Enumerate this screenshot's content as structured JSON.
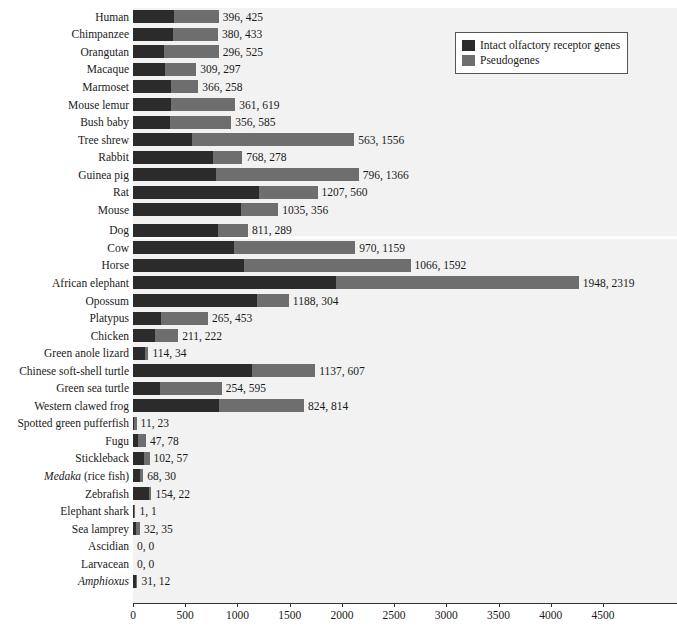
{
  "legend": {
    "position": "top-right",
    "items": [
      {
        "label": "Intact olfactory receptor genes",
        "color": "#2b2b2b",
        "name": "intact"
      },
      {
        "label": "Pseudogenes",
        "color": "#6e6e6e",
        "name": "pseudogenes"
      }
    ]
  },
  "chart_data": {
    "type": "bar",
    "orientation": "horizontal",
    "stacked": true,
    "title": "",
    "xlabel": "",
    "ylabel": "",
    "xlim": [
      0,
      4700
    ],
    "xticks": [
      0,
      500,
      1000,
      1500,
      2000,
      2500,
      3000,
      3500,
      4000,
      4500
    ],
    "xticklabels": [
      "0",
      "500",
      "1000",
      "1500",
      "2000",
      "2500",
      "3000",
      "3500",
      "4000",
      "4500"
    ],
    "grid": false,
    "legend_entries": [
      "Intact olfactory receptor genes",
      "Pseudogenes"
    ],
    "series": [
      {
        "name": "Intact olfactory receptor genes",
        "color": "#2b2b2b",
        "values": [
          396,
          380,
          296,
          309,
          366,
          361,
          356,
          563,
          768,
          796,
          1207,
          1035,
          811,
          970,
          1066,
          1948,
          1188,
          265,
          211,
          114,
          1137,
          254,
          824,
          11,
          47,
          102,
          68,
          154,
          1,
          32,
          0,
          0,
          31
        ]
      },
      {
        "name": "Pseudogenes",
        "color": "#6e6e6e",
        "values": [
          425,
          433,
          525,
          297,
          258,
          619,
          585,
          1556,
          278,
          1366,
          560,
          356,
          289,
          1159,
          1592,
          2319,
          304,
          453,
          222,
          34,
          607,
          595,
          814,
          23,
          78,
          57,
          30,
          22,
          1,
          35,
          0,
          0,
          12
        ]
      }
    ],
    "categories": [
      "Human",
      "Chimpanzee",
      "Orangutan",
      "Macaque",
      "Marmoset",
      "Mouse lemur",
      "Bush baby",
      "Tree shrew",
      "Rabbit",
      "Guinea pig",
      "Rat",
      "Mouse",
      "Dog",
      "Cow",
      "Horse",
      "African elephant",
      "Opossum",
      "Platypus",
      "Chicken",
      "Green anole lizard",
      "Chinese soft-shell turtle",
      "Green sea turtle",
      "Western clawed frog",
      "Spotted green pufferfish",
      "Fugu",
      "Stickleback",
      "Medaka (rice fish)",
      "Zebrafish",
      "Elephant shark",
      "Sea lamprey",
      "Ascidian",
      "Larvacean",
      "Amphioxus"
    ],
    "rows": [
      {
        "label": "Human",
        "label_italic_part": "",
        "intact": 396,
        "pseudo": 425,
        "value_text": "396, 425",
        "gap_before": false
      },
      {
        "label": "Chimpanzee",
        "label_italic_part": "",
        "intact": 380,
        "pseudo": 433,
        "value_text": "380, 433",
        "gap_before": false
      },
      {
        "label": "Orangutan",
        "label_italic_part": "",
        "intact": 296,
        "pseudo": 525,
        "value_text": "296, 525",
        "gap_before": false
      },
      {
        "label": "Macaque",
        "label_italic_part": "",
        "intact": 309,
        "pseudo": 297,
        "value_text": "309, 297",
        "gap_before": false
      },
      {
        "label": "Marmoset",
        "label_italic_part": "",
        "intact": 366,
        "pseudo": 258,
        "value_text": "366, 258",
        "gap_before": false
      },
      {
        "label": "Mouse lemur",
        "label_italic_part": "",
        "intact": 361,
        "pseudo": 619,
        "value_text": "361, 619",
        "gap_before": false
      },
      {
        "label": "Bush baby",
        "label_italic_part": "",
        "intact": 356,
        "pseudo": 585,
        "value_text": "356, 585",
        "gap_before": false
      },
      {
        "label": "Tree shrew",
        "label_italic_part": "",
        "intact": 563,
        "pseudo": 1556,
        "value_text": "563, 1556",
        "gap_before": false
      },
      {
        "label": "Rabbit",
        "label_italic_part": "",
        "intact": 768,
        "pseudo": 278,
        "value_text": "768, 278",
        "gap_before": false
      },
      {
        "label": "Guinea pig",
        "label_italic_part": "",
        "intact": 796,
        "pseudo": 1366,
        "value_text": "796, 1366",
        "gap_before": false
      },
      {
        "label": "Rat",
        "label_italic_part": "",
        "intact": 1207,
        "pseudo": 560,
        "value_text": "1207, 560",
        "gap_before": false
      },
      {
        "label": "Mouse",
        "label_italic_part": "",
        "intact": 1035,
        "pseudo": 356,
        "value_text": "1035, 356",
        "gap_before": false
      },
      {
        "label": "Dog",
        "label_italic_part": "",
        "intact": 811,
        "pseudo": 289,
        "value_text": "811, 289",
        "gap_before": true
      },
      {
        "label": "Cow",
        "label_italic_part": "",
        "intact": 970,
        "pseudo": 1159,
        "value_text": "970, 1159",
        "gap_before": false
      },
      {
        "label": "Horse",
        "label_italic_part": "",
        "intact": 1066,
        "pseudo": 1592,
        "value_text": "1066, 1592",
        "gap_before": false
      },
      {
        "label": "African elephant",
        "label_italic_part": "",
        "intact": 1948,
        "pseudo": 2319,
        "value_text": "1948, 2319",
        "gap_before": false
      },
      {
        "label": "Opossum",
        "label_italic_part": "",
        "intact": 1188,
        "pseudo": 304,
        "value_text": "1188, 304",
        "gap_before": false
      },
      {
        "label": "Platypus",
        "label_italic_part": "",
        "intact": 265,
        "pseudo": 453,
        "value_text": "265, 453",
        "gap_before": false
      },
      {
        "label": "Chicken",
        "label_italic_part": "",
        "intact": 211,
        "pseudo": 222,
        "value_text": "211, 222",
        "gap_before": false
      },
      {
        "label": "Green anole lizard",
        "label_italic_part": "",
        "intact": 114,
        "pseudo": 34,
        "value_text": "114, 34",
        "gap_before": false
      },
      {
        "label": "Chinese soft-shell turtle",
        "label_italic_part": "",
        "intact": 1137,
        "pseudo": 607,
        "value_text": "1137, 607",
        "gap_before": false
      },
      {
        "label": "Green sea turtle",
        "label_italic_part": "",
        "intact": 254,
        "pseudo": 595,
        "value_text": "254, 595",
        "gap_before": false
      },
      {
        "label": "Western clawed frog",
        "label_italic_part": "",
        "intact": 824,
        "pseudo": 814,
        "value_text": "824, 814",
        "gap_before": false
      },
      {
        "label": "Spotted green pufferfish",
        "label_italic_part": "",
        "intact": 11,
        "pseudo": 23,
        "value_text": "11, 23",
        "gap_before": false
      },
      {
        "label": "Fugu",
        "label_italic_part": "",
        "intact": 47,
        "pseudo": 78,
        "value_text": "47, 78",
        "gap_before": false
      },
      {
        "label": "Stickleback",
        "label_italic_part": "",
        "intact": 102,
        "pseudo": 57,
        "value_text": "102, 57",
        "gap_before": false
      },
      {
        "label": "Medaka (rice fish)",
        "label_italic_part": "Medaka",
        "label_rest": " (rice fish)",
        "intact": 68,
        "pseudo": 30,
        "value_text": "68, 30",
        "gap_before": false
      },
      {
        "label": "Zebrafish",
        "label_italic_part": "",
        "intact": 154,
        "pseudo": 22,
        "value_text": "154, 22",
        "gap_before": false
      },
      {
        "label": "Elephant shark",
        "label_italic_part": "",
        "intact": 1,
        "pseudo": 1,
        "value_text": "1, 1",
        "gap_before": false
      },
      {
        "label": "Sea lamprey",
        "label_italic_part": "",
        "intact": 32,
        "pseudo": 35,
        "value_text": "32, 35",
        "gap_before": false
      },
      {
        "label": "Ascidian",
        "label_italic_part": "",
        "intact": 0,
        "pseudo": 0,
        "value_text": "0, 0",
        "gap_before": false
      },
      {
        "label": "Larvacean",
        "label_italic_part": "",
        "intact": 0,
        "pseudo": 0,
        "value_text": "0, 0",
        "gap_before": false
      },
      {
        "label": "Amphioxus",
        "label_italic_part": "Amphioxus",
        "label_rest": "",
        "intact": 31,
        "pseudo": 12,
        "value_text": "31, 12",
        "gap_before": false
      }
    ]
  },
  "colors": {
    "intact": "#2b2b2b",
    "pseudogenes": "#6e6e6e",
    "plot_background": "#f2f2f2",
    "axis": "#333333",
    "text": "#1a1a1a"
  }
}
